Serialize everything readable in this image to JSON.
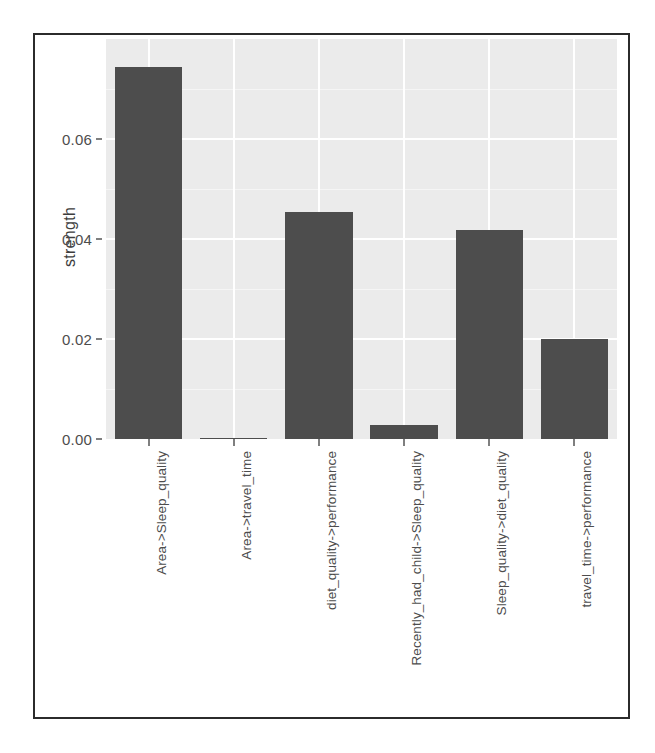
{
  "chart_data": {
    "type": "bar",
    "title": "",
    "xlabel": "",
    "ylabel": "strength",
    "categories": [
      "Area->Sleep_quality",
      "Area->travel_time",
      "diet_quality->performance",
      "Recently_had_child->Sleep_quality",
      "Sleep_quality->diet_quality",
      "travel_time->performance"
    ],
    "values": [
      0.0744,
      0.0002,
      0.0454,
      0.0028,
      0.0418,
      0.02
    ],
    "ylim": [
      0.0,
      0.08
    ],
    "ytick_labels": [
      "0.00",
      "0.02",
      "0.04",
      "0.06"
    ],
    "ytick_values": [
      0.0,
      0.02,
      0.04,
      0.06
    ],
    "grid": true,
    "legend": "none",
    "bar_color": "#4d4d4d",
    "panel_background": "#ebebeb",
    "gridline_color": "#ffffff"
  }
}
